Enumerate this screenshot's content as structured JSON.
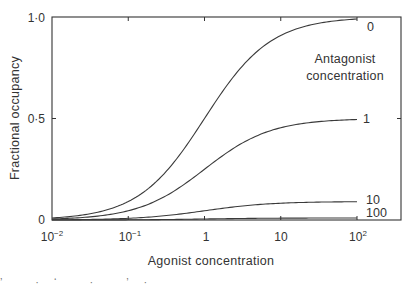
{
  "chart_data": {
    "type": "line",
    "title": "",
    "xlabel": "Agonist concentration",
    "ylabel": "Fractional occupancy",
    "xscale": "log",
    "xlim": [
      0.01,
      100
    ],
    "ylim": [
      0,
      1.0
    ],
    "grid": false,
    "x_ticks": [
      {
        "value": 0.01,
        "label_base": "10",
        "label_exp": "−2"
      },
      {
        "value": 0.1,
        "label_base": "10",
        "label_exp": "−1"
      },
      {
        "value": 1,
        "label_base": "1",
        "label_exp": ""
      },
      {
        "value": 10,
        "label_base": "10",
        "label_exp": ""
      },
      {
        "value": 100,
        "label_base": "10",
        "label_exp": "2"
      }
    ],
    "y_ticks": [
      {
        "value": 0,
        "label": "0"
      },
      {
        "value": 0.5,
        "label": "0·5"
      },
      {
        "value": 1.0,
        "label": "1·0"
      }
    ],
    "legend": {
      "title_line1": "Antagonist",
      "title_line2": "concentration",
      "position": "right, inline labels at curve ends"
    },
    "x": [
      0.01,
      0.03,
      0.1,
      0.3,
      1,
      3,
      10,
      30,
      100
    ],
    "series": [
      {
        "name": "0",
        "antagonist": 0,
        "values": [
          0.01,
          0.03,
          0.09,
          0.23,
          0.5,
          0.75,
          0.91,
          0.97,
          0.99
        ]
      },
      {
        "name": "1",
        "antagonist": 1,
        "values": [
          0.005,
          0.015,
          0.045,
          0.115,
          0.25,
          0.375,
          0.455,
          0.485,
          0.495
        ]
      },
      {
        "name": "10",
        "antagonist": 10,
        "values": [
          0.001,
          0.003,
          0.008,
          0.021,
          0.045,
          0.068,
          0.083,
          0.088,
          0.09
        ]
      },
      {
        "name": "100",
        "antagonist": 100,
        "values": [
          0.0001,
          0.0003,
          0.0009,
          0.0023,
          0.005,
          0.0074,
          0.009,
          0.0096,
          0.0098
        ]
      }
    ]
  },
  "footer_fragment": "’ . · ‘ . · , ’ ·"
}
